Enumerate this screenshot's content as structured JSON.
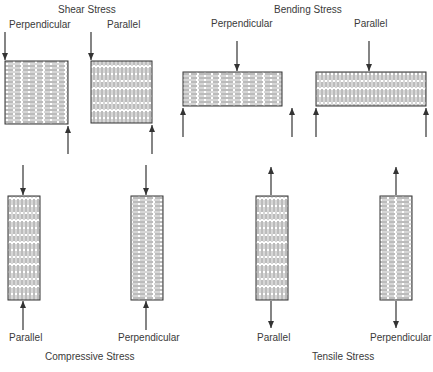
{
  "sections": {
    "shear": {
      "title": "Shear Stress",
      "left_label": "Perpendicular",
      "right_label": "Parallel"
    },
    "bending": {
      "title": "Bending Stress",
      "left_label": "Perpendicular",
      "right_label": "Parallel"
    },
    "compressive": {
      "title": "Compressive Stress",
      "left_label": "Parallel",
      "right_label": "Perpendicular"
    },
    "tensile": {
      "title": "Tensile Stress",
      "left_label": "Parallel",
      "right_label": "Perpendicular"
    }
  },
  "colors": {
    "line": "#333333",
    "text": "#3a3a3a"
  }
}
